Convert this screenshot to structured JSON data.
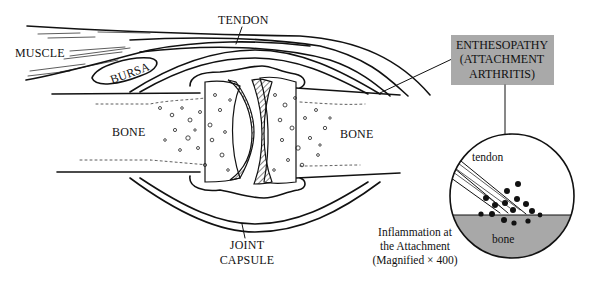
{
  "diagram": {
    "labels": {
      "muscle": "MUSCLE",
      "tendon": "TENDON",
      "bursa": "BURSA",
      "bone_left": "BONE",
      "bone_right": "BONE",
      "joint_capsule_line1": "JOINT",
      "joint_capsule_line2": "CAPSULE"
    },
    "callout_box": {
      "line1": "ENTHESOPATHY",
      "line2": "(ATTACHMENT",
      "line3": "ARTHRITIS)",
      "fill": "#a9a9a9"
    },
    "magnified_view": {
      "tendon_label": "tendon",
      "bone_label": "bone",
      "bone_fill": "#a8a8a8",
      "caption_line1": "Inflammation at",
      "caption_line2": "the Attachment",
      "caption_line3": "(Magnified × 400)"
    }
  }
}
